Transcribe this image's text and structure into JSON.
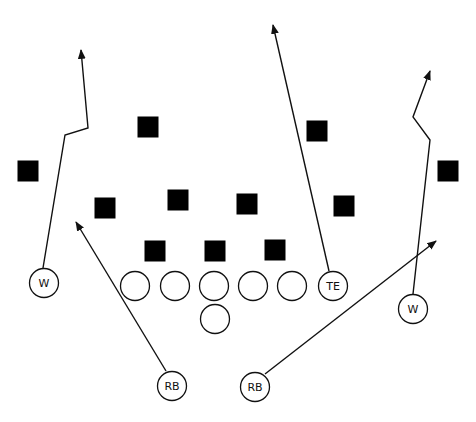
{
  "diagram": {
    "title": "",
    "colors": {
      "background": "#ffffff",
      "ink": "#111111",
      "defender": "#000000"
    },
    "defenders": [
      {
        "x": 148,
        "y": 127
      },
      {
        "x": 28,
        "y": 171
      },
      {
        "x": 105,
        "y": 208
      },
      {
        "x": 178,
        "y": 200
      },
      {
        "x": 247,
        "y": 204
      },
      {
        "x": 317,
        "y": 131
      },
      {
        "x": 344,
        "y": 206
      },
      {
        "x": 155,
        "y": 251
      },
      {
        "x": 215,
        "y": 251
      },
      {
        "x": 275,
        "y": 250
      },
      {
        "x": 448,
        "y": 171
      }
    ],
    "offense": [
      {
        "id": "left-wide-receiver",
        "label": "W",
        "x": 44,
        "y": 283
      },
      {
        "id": "lineman-1",
        "label": "",
        "x": 135,
        "y": 286
      },
      {
        "id": "lineman-2",
        "label": "",
        "x": 175,
        "y": 286
      },
      {
        "id": "center",
        "label": "",
        "x": 214,
        "y": 286
      },
      {
        "id": "lineman-4",
        "label": "",
        "x": 253,
        "y": 286
      },
      {
        "id": "lineman-5",
        "label": "",
        "x": 292,
        "y": 286
      },
      {
        "id": "quarterback",
        "label": "",
        "x": 215,
        "y": 319
      },
      {
        "id": "tight-end",
        "label": "TE",
        "x": 333,
        "y": 286
      },
      {
        "id": "right-wide-receiver",
        "label": "W",
        "x": 413,
        "y": 309
      },
      {
        "id": "left-running-back",
        "label": "RB",
        "x": 172,
        "y": 386
      },
      {
        "id": "right-running-back",
        "label": "RB",
        "x": 255,
        "y": 387
      }
    ],
    "routes": [
      {
        "id": "left-w-route",
        "points": "43,268 65,135 88,128 81,50"
      },
      {
        "id": "te-route",
        "points": "329,271 273,25"
      },
      {
        "id": "right-w-route",
        "points": "413,294 430,140 413,117 430,71"
      },
      {
        "id": "left-rb-route",
        "points": "166,371 76,222"
      },
      {
        "id": "right-rb-route",
        "points": "265,374 436,241"
      }
    ]
  }
}
